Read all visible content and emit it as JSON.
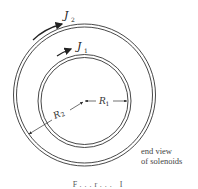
{
  "figure": {
    "labels": {
      "j2_main": "J",
      "j2_sub": "2",
      "j1_main": "J",
      "j1_sub": "1",
      "r1_main": "R",
      "r1_sub": "1",
      "r2_main": "R",
      "r2_sub": "2"
    },
    "note_line1": "end view",
    "note_line2": "of solenoids",
    "caption": "F...r... I"
  },
  "colors": {
    "stroke": "#333333",
    "background": "#ffffff"
  }
}
